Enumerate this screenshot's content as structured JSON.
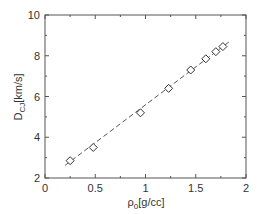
{
  "chart_data": {
    "type": "scatter",
    "title": "",
    "xlabel": "ρ0[g/cc]",
    "xlabel_main": "ρ",
    "xlabel_sub": "0",
    "xlabel_unit": "[g/cc]",
    "ylabel": "DCJ[km/s]",
    "ylabel_main": "D",
    "ylabel_sub": "CJ",
    "ylabel_unit": "[km/s]",
    "xlim": [
      0,
      2
    ],
    "ylim": [
      2,
      10
    ],
    "x_ticks": [
      0,
      0.5,
      1,
      1.5,
      2
    ],
    "x_tick_labels": [
      "0",
      "0.5",
      "1",
      "1.5",
      "2"
    ],
    "y_ticks": [
      2,
      4,
      6,
      8,
      10
    ],
    "y_tick_labels": [
      "2",
      "4",
      "6",
      "8",
      "10"
    ],
    "grid": false,
    "legend": null,
    "series": [
      {
        "name": "measured",
        "marker": "diamond-open",
        "line": "none",
        "x": [
          0.25,
          0.48,
          0.95,
          1.23,
          1.45,
          1.6,
          1.7,
          1.77
        ],
        "y": [
          2.85,
          3.5,
          5.2,
          6.4,
          7.3,
          7.85,
          8.2,
          8.45
        ]
      },
      {
        "name": "fit",
        "marker": "none",
        "line": "dashed",
        "x": [
          0.2,
          1.85
        ],
        "y": [
          2.62,
          8.75
        ]
      }
    ]
  },
  "colors": {
    "axis": "#555555",
    "marker": "#333333",
    "fit_line": "#555555",
    "background": "#ffffff"
  }
}
